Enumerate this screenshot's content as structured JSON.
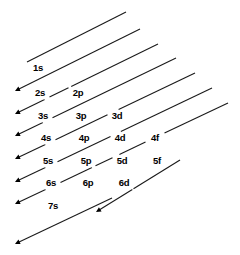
{
  "diagram": {
    "background_color": "#ffffff",
    "line_color": "#1a1a1a",
    "text_color": "#000000",
    "width": 240,
    "height": 255,
    "columns": [
      {
        "subshell": "s",
        "x": 32
      },
      {
        "subshell": "p",
        "x": 69
      },
      {
        "subshell": "d",
        "x": 105
      },
      {
        "subshell": "f",
        "x": 142
      }
    ],
    "rows": [
      {
        "n": 1,
        "y": 68
      },
      {
        "n": 2,
        "y": 93
      },
      {
        "n": 3,
        "y": 116
      },
      {
        "n": 4,
        "y": 138
      },
      {
        "n": 5,
        "y": 161
      },
      {
        "n": 6,
        "y": 183
      },
      {
        "n": 7,
        "y": 206
      }
    ],
    "labels": [
      {
        "text": "1s",
        "x": 38,
        "y": 68
      },
      {
        "text": "2s",
        "x": 40,
        "y": 93
      },
      {
        "text": "2p",
        "x": 78,
        "y": 93
      },
      {
        "text": "3s",
        "x": 43,
        "y": 116
      },
      {
        "text": "3p",
        "x": 81,
        "y": 116
      },
      {
        "text": "3d",
        "x": 117,
        "y": 116
      },
      {
        "text": "4s",
        "x": 46,
        "y": 138
      },
      {
        "text": "4p",
        "x": 84,
        "y": 138
      },
      {
        "text": "4d",
        "x": 120,
        "y": 138
      },
      {
        "text": "4f",
        "x": 155,
        "y": 138
      },
      {
        "text": "5s",
        "x": 48,
        "y": 161
      },
      {
        "text": "5p",
        "x": 86,
        "y": 161
      },
      {
        "text": "5d",
        "x": 122,
        "y": 161
      },
      {
        "text": "5f",
        "x": 157,
        "y": 161
      },
      {
        "text": "6s",
        "x": 51,
        "y": 183
      },
      {
        "text": "6p",
        "x": 88,
        "y": 183
      },
      {
        "text": "6d",
        "x": 124,
        "y": 183
      },
      {
        "text": "7s",
        "x": 53,
        "y": 206
      }
    ],
    "arrows": [
      {
        "name": "arrow-1s",
        "x1": 126,
        "y1": 12,
        "x2": 27,
        "y2": 62,
        "arrowhead": false
      },
      {
        "name": "arrow-2s-2p",
        "x1": 140,
        "y1": 29,
        "x2": 15,
        "y2": 91,
        "arrowhead": true
      },
      {
        "name": "arrow-3s-3p",
        "x1": 158,
        "y1": 44,
        "x2": 15,
        "y2": 114,
        "arrowhead": true
      },
      {
        "name": "arrow-4s-3d-4p",
        "x1": 176,
        "y1": 58,
        "x2": 15,
        "y2": 136,
        "arrowhead": true
      },
      {
        "name": "arrow-5s-4d-5p",
        "x1": 195,
        "y1": 73,
        "x2": 15,
        "y2": 159,
        "arrowhead": true
      },
      {
        "name": "arrow-6s-4f-5d-6p",
        "x1": 212,
        "y1": 88,
        "x2": 15,
        "y2": 182,
        "arrowhead": true
      },
      {
        "name": "arrow-7s-5f-6d-7p",
        "x1": 228,
        "y1": 103,
        "x2": 15,
        "y2": 204,
        "arrowhead": true
      },
      {
        "name": "arrow-bottom-6d",
        "x1": 180,
        "y1": 160,
        "x2": 96,
        "y2": 212,
        "arrowhead": true
      },
      {
        "name": "arrow-last-7s",
        "x1": 112,
        "y1": 198,
        "x2": 15,
        "y2": 244,
        "arrowhead": true
      }
    ],
    "arrowhead": {
      "size": 5,
      "color": "#000000"
    },
    "line_width": 1.1,
    "label_gap_radius": 10
  }
}
